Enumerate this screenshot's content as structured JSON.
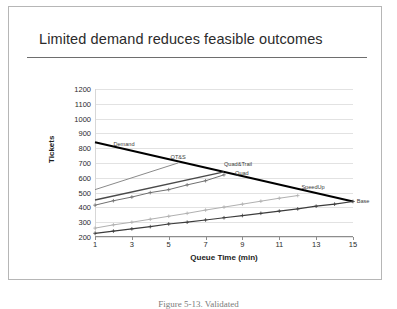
{
  "slide": {
    "title": "Limited demand reduces feasible outcomes",
    "caption": "Figure 5-13.  Validated"
  },
  "colors": {
    "demand": "#000000",
    "qts": "#8a8a8a",
    "quad_trail": "#4a4a4a",
    "quad": "#707070",
    "speedup": "#b0b0b0",
    "base": "#3c3c3c",
    "gridline": "#e2e2e2",
    "axis": "#8d8d8d",
    "title_rule": "#6e6e6e",
    "slide_border": "#b6b6b6"
  },
  "chart_data": {
    "type": "line",
    "title": "",
    "xlabel": "Queue Time (min)",
    "ylabel": "Tickets",
    "xlim": [
      1,
      15
    ],
    "ylim": [
      200,
      1200
    ],
    "grid": true,
    "legend_position": "inline-end-labels",
    "yticks": [
      200,
      300,
      400,
      500,
      600,
      700,
      800,
      900,
      1000,
      1100,
      1200
    ],
    "xticks": [
      1,
      3,
      5,
      7,
      9,
      11,
      13,
      15
    ],
    "series": [
      {
        "name": "Demand",
        "color": "#000000",
        "width": 2.0,
        "markers": false,
        "label_x": 2.0,
        "label_y": 828,
        "x": [
          1,
          15
        ],
        "values": [
          840,
          440
        ]
      },
      {
        "name": "QT&S",
        "color": "#8a8a8a",
        "width": 1.0,
        "markers": false,
        "label_x": 5.1,
        "label_y": 742,
        "x": [
          1,
          5.5
        ],
        "values": [
          520,
          700
        ]
      },
      {
        "name": "Quad&Trail",
        "color": "#4a4a4a",
        "width": 1.4,
        "markers": false,
        "label_x": 8.0,
        "label_y": 692,
        "x": [
          1,
          8
        ],
        "values": [
          450,
          640
        ]
      },
      {
        "name": "Quad",
        "color": "#707070",
        "width": 1.0,
        "markers": true,
        "label_x": 8.6,
        "label_y": 632,
        "x": [
          1,
          2,
          3,
          4,
          5,
          6,
          7,
          8
        ],
        "values": [
          415,
          445,
          470,
          500,
          520,
          552,
          580,
          620
        ]
      },
      {
        "name": "SpeedUp",
        "color": "#b0b0b0",
        "width": 1.0,
        "markers": true,
        "label_x": 12.2,
        "label_y": 538,
        "x": [
          1,
          2,
          3,
          4,
          5,
          6,
          7,
          8,
          9,
          10,
          11,
          12
        ],
        "values": [
          260,
          282,
          300,
          320,
          340,
          360,
          382,
          402,
          422,
          442,
          462,
          480
        ]
      },
      {
        "name": "Base",
        "color": "#3c3c3c",
        "width": 1.2,
        "markers": true,
        "label_x": 15.2,
        "label_y": 440,
        "x": [
          1,
          2,
          3,
          4,
          5,
          6,
          7,
          8,
          9,
          10,
          11,
          12,
          13,
          14,
          15
        ],
        "values": [
          225,
          240,
          255,
          270,
          288,
          300,
          315,
          330,
          345,
          360,
          375,
          390,
          408,
          422,
          440
        ]
      }
    ]
  }
}
